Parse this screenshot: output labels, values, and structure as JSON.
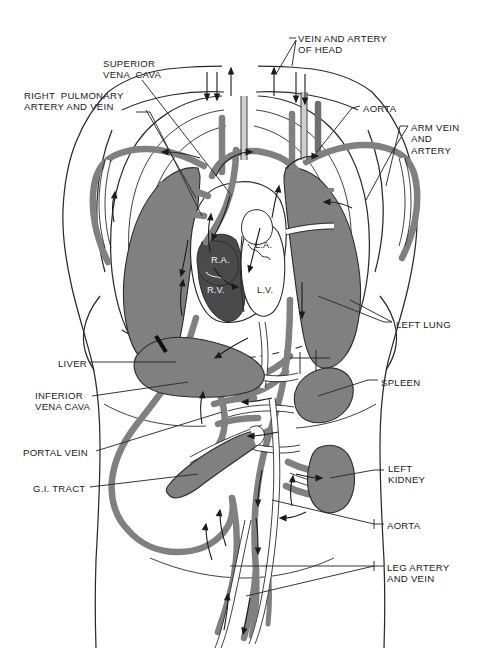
{
  "figure": {
    "colors": {
      "background": "#ffffff",
      "organ_fill": "#808080",
      "vessel_fill": "#808080",
      "vessel_light": "#ffffff",
      "outline": "#2b2b2b",
      "label_text": "#1a1a1a",
      "leader_line": "#2b2b2b"
    }
  },
  "labels_left": [
    {
      "id": "superior-vena-cava",
      "text": "SUPERIOR\nVENA  CAVA",
      "x": 103,
      "y": 58
    },
    {
      "id": "right-pulmonary-artery-and-vein",
      "text": "RIGHT  PULMONARY\nARTERY AND VEIN",
      "x": 24,
      "y": 90
    },
    {
      "id": "liver",
      "text": "LIVER",
      "x": 58,
      "y": 358
    },
    {
      "id": "inferior-vena-cava",
      "text": "INFERIOR\nVENA CAVA",
      "x": 35,
      "y": 390
    },
    {
      "id": "portal-vein",
      "text": "PORTAL VEIN",
      "x": 23,
      "y": 447
    },
    {
      "id": "gi-tract",
      "text": "G.I. TRACT",
      "x": 33,
      "y": 483
    }
  ],
  "labels_right": [
    {
      "id": "vein-and-artery-of-head",
      "text": "VEIN AND ARTERY\nOF HEAD",
      "x": 298,
      "y": 33
    },
    {
      "id": "aorta-top",
      "text": "AORTA",
      "x": 363,
      "y": 103
    },
    {
      "id": "arm-vein-and-artery",
      "text": "ARM VEIN\nAND\nARTERY",
      "x": 411,
      "y": 122
    },
    {
      "id": "left-lung",
      "text": "LEFT LUNG",
      "x": 396,
      "y": 319
    },
    {
      "id": "spleen",
      "text": "SPLEEN",
      "x": 381,
      "y": 377
    },
    {
      "id": "left-kidney",
      "text": "LEFT\nKIDNEY",
      "x": 388,
      "y": 463
    },
    {
      "id": "aorta-bottom",
      "text": "AORTA",
      "x": 387,
      "y": 520
    },
    {
      "id": "leg-artery-and-vein",
      "text": "LEG ARTERY\nAND VEIN",
      "x": 387,
      "y": 562
    }
  ],
  "heart_chambers": [
    {
      "id": "right-atrium",
      "text": "R.A.",
      "x": 211,
      "y": 255,
      "tone": "light"
    },
    {
      "id": "right-ventricle",
      "text": "R.V.",
      "x": 207,
      "y": 285,
      "tone": "light"
    },
    {
      "id": "left-atrium",
      "text": "L.A.",
      "x": 255,
      "y": 240,
      "tone": "dark"
    },
    {
      "id": "left-ventricle",
      "text": "L.V.",
      "x": 257,
      "y": 285,
      "tone": "dark"
    }
  ]
}
